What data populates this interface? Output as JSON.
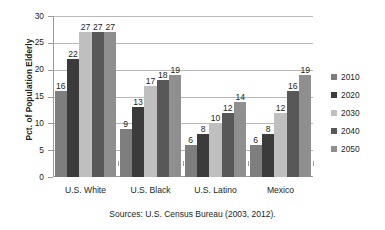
{
  "chart_data": {
    "type": "bar",
    "title": "",
    "xlabel": "",
    "ylabel": "Pct. of Population Elderly",
    "ylim": [
      0,
      30
    ],
    "yticks": [
      0,
      5,
      10,
      15,
      20,
      25,
      30
    ],
    "grid": true,
    "legend_position": "right",
    "categories": [
      "U.S. White",
      "U.S. Black",
      "U.S. Latino",
      "Mexico"
    ],
    "series": [
      {
        "name": "2010",
        "color": "#7e7e7e",
        "values": [
          16,
          9,
          6,
          6
        ]
      },
      {
        "name": "2020",
        "color": "#3b3b3b",
        "values": [
          22,
          13,
          8,
          8
        ]
      },
      {
        "name": "2030",
        "color": "#bfbfbf",
        "values": [
          27,
          17,
          10,
          12
        ]
      },
      {
        "name": "2040",
        "color": "#585858",
        "values": [
          27,
          18,
          12,
          16
        ]
      },
      {
        "name": "2050",
        "color": "#8f8f8f",
        "values": [
          27,
          19,
          14,
          19
        ]
      }
    ],
    "annotation": "Sources: U.S. Census Bureau (2003, 2012)."
  },
  "axis": {
    "y_title": "Pct. of Population Elderly",
    "y_tick_labels": [
      "30",
      "25",
      "20",
      "15",
      "10",
      "5",
      "0"
    ],
    "x_tick_labels": [
      "U.S. White",
      "U.S. Black",
      "U.S. Latino",
      "Mexico"
    ]
  },
  "legend": {
    "items": [
      {
        "label": "2010",
        "color": "#7e7e7e"
      },
      {
        "label": "2020",
        "color": "#3b3b3b"
      },
      {
        "label": "2030",
        "color": "#bfbfbf"
      },
      {
        "label": "2040",
        "color": "#585858"
      },
      {
        "label": "2050",
        "color": "#8f8f8f"
      }
    ]
  },
  "footer": {
    "source": "Sources: U.S. Census Bureau (2003, 2012)."
  },
  "colors": {
    "axis": "#9a9a9a",
    "grid": "#b9b9b9",
    "text": "#231f20",
    "background": "#ffffff"
  }
}
